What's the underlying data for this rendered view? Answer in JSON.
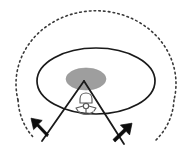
{
  "canvas": {
    "width": 194,
    "height": 167,
    "background_color": "#ffffff",
    "title": "Anatomical beam-spread diagram"
  },
  "palette": {
    "stroke_dark": "#1a1a1a",
    "stroke_medium": "#2b2b2b",
    "dotted_stroke": "#3a3a3a",
    "mass_fill": "#9e9e9e",
    "mass_stroke": "#8a8a8a",
    "arrow_fill": "#0d0d0d",
    "vertebra_stroke": "#555555",
    "background": "#ffffff"
  },
  "chart_data": {
    "type": "diagram",
    "title": "Anatomical beam-spread diagram",
    "elements": [
      {
        "name": "dotted-outer-arc",
        "shape": "ellipse-arc",
        "cx": 96,
        "cy": 88,
        "rx": 80,
        "ry": 73,
        "dash": "1.6 3.2",
        "stroke_width": 1.6,
        "description": "Dotted outer boundary arc representing the full rotational field"
      },
      {
        "name": "solid-plane-ellipse",
        "shape": "ellipse",
        "cx": 96,
        "cy": 81,
        "rx": 59,
        "ry": 33,
        "stroke_width": 1.7,
        "fill": "none",
        "description": "Solid elliptical plane / disc outline"
      },
      {
        "name": "central-mass-ellipse",
        "shape": "ellipse",
        "cx": 86,
        "cy": 79,
        "rx": 20,
        "ry": 11,
        "fill": "#9e9e9e",
        "description": "Grey filled central mass at the apex of the wedge"
      },
      {
        "name": "wedge-left-ray",
        "shape": "line",
        "x1": 84,
        "y1": 81,
        "x2": 42,
        "y2": 141,
        "stroke_width": 1.8
      },
      {
        "name": "wedge-right-ray",
        "shape": "line",
        "x1": 84,
        "y1": 81,
        "x2": 124,
        "y2": 144,
        "stroke_width": 1.8
      },
      {
        "name": "vertebra-icon",
        "shape": "outline-figure",
        "cx": 85,
        "cy": 104,
        "width": 20,
        "height": 20,
        "description": "Small vertebra outline inside the wedge"
      },
      {
        "name": "rotation-arrow-left",
        "shape": "arrow",
        "direction": "up-left",
        "tail_x": 47,
        "tail_y": 133,
        "tip_x": 32,
        "tip_y": 119,
        "description": "Bold solid arrow indicating leftward rotation"
      },
      {
        "name": "rotation-arrow-right",
        "shape": "arrow",
        "direction": "up-right",
        "tail_x": 114,
        "tail_y": 138,
        "tip_x": 133,
        "tip_y": 124,
        "description": "Bold solid arrow indicating rightward rotation"
      }
    ],
    "labels": [],
    "legend": [],
    "annotations": []
  }
}
